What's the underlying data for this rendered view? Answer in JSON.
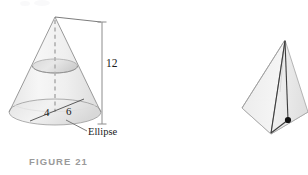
{
  "page": {
    "background_color": "#ffffff",
    "width": 308,
    "height": 175
  },
  "figures": [
    {
      "id": "figure-21",
      "caption": "FIGURE 21",
      "subject": "cone",
      "description": "Right circular cone with a horizontal elliptical cross-section, dashed central axis, labeled base radii and height",
      "labels": {
        "height": "12",
        "radius_left": "4",
        "radius_right": "6",
        "cross_section": "Ellipse"
      },
      "colors": {
        "body_fill": "#f2f2f2",
        "body_fill_shadow": "#e2e2e2",
        "outline": "#9a9a9a",
        "dashed_axis": "#b5b5b5",
        "dimension_line": "#8c8c8c",
        "label_text": "#1a1a1a",
        "caption_text": "#9a9a9a"
      }
    },
    {
      "id": "figure-22",
      "caption": "FIGURE 22",
      "subject": "pyramid",
      "description": "Square-based pyramid in oblique view with slant edge labeled s, lines from apex to a front base vertex and to the marked base center point",
      "labels": {
        "slant_edge": "s"
      },
      "colors": {
        "body_fill": "#f0f0f0",
        "body_fill_shadow": "#e4e4e4",
        "outline": "#a5a5a5",
        "inner_line": "#3c3c3c",
        "center_dot": "#111111",
        "label_text": "#1a1a1a",
        "caption_text": "#9a9a9a"
      }
    }
  ]
}
